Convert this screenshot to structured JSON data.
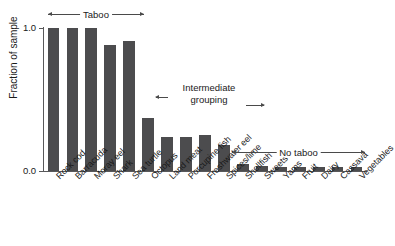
{
  "chart_data": {
    "type": "bar",
    "title": "",
    "xlabel": "",
    "ylabel": "Fraction of sample",
    "ylim": [
      0.0,
      1.0
    ],
    "ytick_labels": [
      "0.0",
      "1.0"
    ],
    "grid": false,
    "legend": "none",
    "bar_color": "#4c4c4e",
    "categories": [
      "Rock cod",
      "Barracuda",
      "Moray eel",
      "Shark",
      "Sea turtle",
      "Octopus",
      "Land meat",
      "Porcupine fish",
      "Freshwater eel",
      "Spices/lime",
      "Shellfish",
      "Sweets",
      "Yams",
      "Fruit",
      "Dairy",
      "Cassava",
      "Vegetables"
    ],
    "values": [
      1.0,
      1.0,
      1.0,
      0.88,
      0.91,
      0.37,
      0.24,
      0.24,
      0.25,
      0.18,
      0.05,
      0.035,
      0.03,
      0.03,
      0.03,
      0.03,
      0.03
    ],
    "annotations": [
      {
        "label": "Taboo",
        "span_start": "Rock cod",
        "span_end": "Sea turtle",
        "style": "double-arrow"
      },
      {
        "label": "Intermediate grouping",
        "span_start": "Octopus",
        "span_end": "Spices/lime",
        "style": "double-arrow"
      },
      {
        "label": "No taboo",
        "span_start": "Shellfish",
        "span_end": "Vegetables",
        "style": "double-arrow"
      }
    ]
  },
  "axis": {
    "y_top_label": "1.0",
    "y_bottom_label": "0.0",
    "y_title": "Fraction of sample"
  },
  "annotations": {
    "taboo": "Taboo",
    "intermediate_line1": "Intermediate",
    "intermediate_line2": "grouping",
    "no_taboo": "No taboo"
  }
}
